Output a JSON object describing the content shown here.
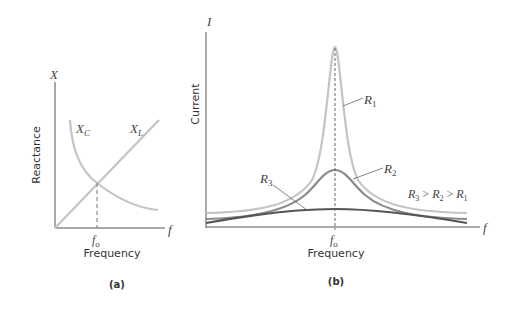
{
  "panel_a": {
    "caption": "(a)",
    "y_axis_symbol": "X",
    "y_axis_label": "Reactance",
    "x_axis_symbol": "f",
    "x_axis_label": "Frequency",
    "resonance_tick": "f",
    "resonance_sub": "o",
    "curve_capacitive": {
      "main": "X",
      "sub": "C"
    },
    "curve_inductive": {
      "main": "X",
      "sub": "L"
    }
  },
  "panel_b": {
    "caption": "(b)",
    "y_axis_symbol": "I",
    "y_axis_label": "Current",
    "x_axis_symbol": "f",
    "x_axis_label": "Frequency",
    "resonance_tick": "f",
    "resonance_sub": "o",
    "curves": [
      {
        "main": "R",
        "sub": "1"
      },
      {
        "main": "R",
        "sub": "2"
      },
      {
        "main": "R",
        "sub": "3"
      }
    ],
    "relation": {
      "r3": "R",
      "r3s": "3",
      "gt1": " > ",
      "r2": "R",
      "r2s": "2",
      "gt2": " > ",
      "r1": "R",
      "r1s": "1"
    }
  },
  "colors": {
    "axis": "#555555",
    "light_curve": "#c4c4c4",
    "mid_curve": "#8a8a8a",
    "dark_curve": "#555555"
  }
}
